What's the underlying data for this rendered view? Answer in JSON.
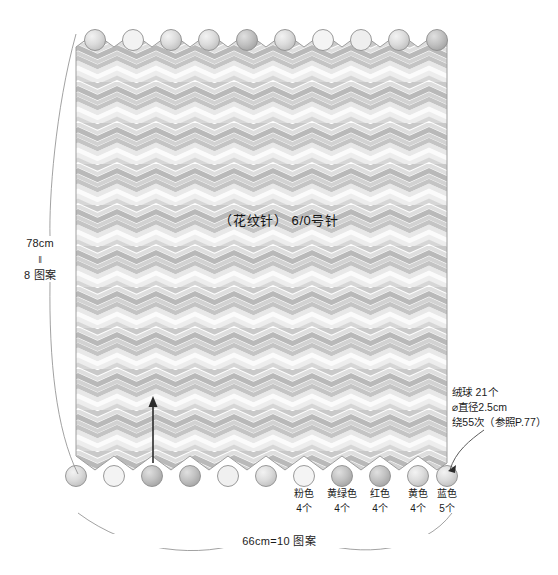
{
  "diagram": {
    "kind": "knitting-pattern-schematic",
    "center_note": "（花纹针） 6/0号针",
    "left_dimension": {
      "value": "78cm",
      "equals_sign": "‖",
      "repeat": "8 图案"
    },
    "bottom_dimension": "66cm=10 图案",
    "pompom_note": {
      "line1": "绒球  21个",
      "line2": "⌀直径2.5cm",
      "line3": "绕55次（参照P.77）"
    },
    "direction_arrow": "up-arrow-knitting-direction",
    "color_legend": [
      {
        "name": "粉色",
        "count": "4个",
        "swatch": "#f0c6cf"
      },
      {
        "name": "黄绿色",
        "count": "4个",
        "swatch": "#cddf9a"
      },
      {
        "name": "红色",
        "count": "4个",
        "swatch": "#e2868a"
      },
      {
        "name": "黄色",
        "count": "4个",
        "swatch": "#f0dc92"
      },
      {
        "name": "蓝色",
        "count": "5个",
        "swatch": "#a9c6de"
      }
    ],
    "top_pompom_count": 10,
    "bottom_pompom_count": 11,
    "fabric": {
      "stitch_pattern": "chevron-wave-stripe",
      "tone_light": "#ffffff",
      "tone_mid": "#d9d9d9",
      "tone_dark": "#b4b4b4",
      "outline": "#9a9a9a"
    },
    "pompom_fill": "#d8d8d8",
    "line_color": "#6e6e6e"
  }
}
